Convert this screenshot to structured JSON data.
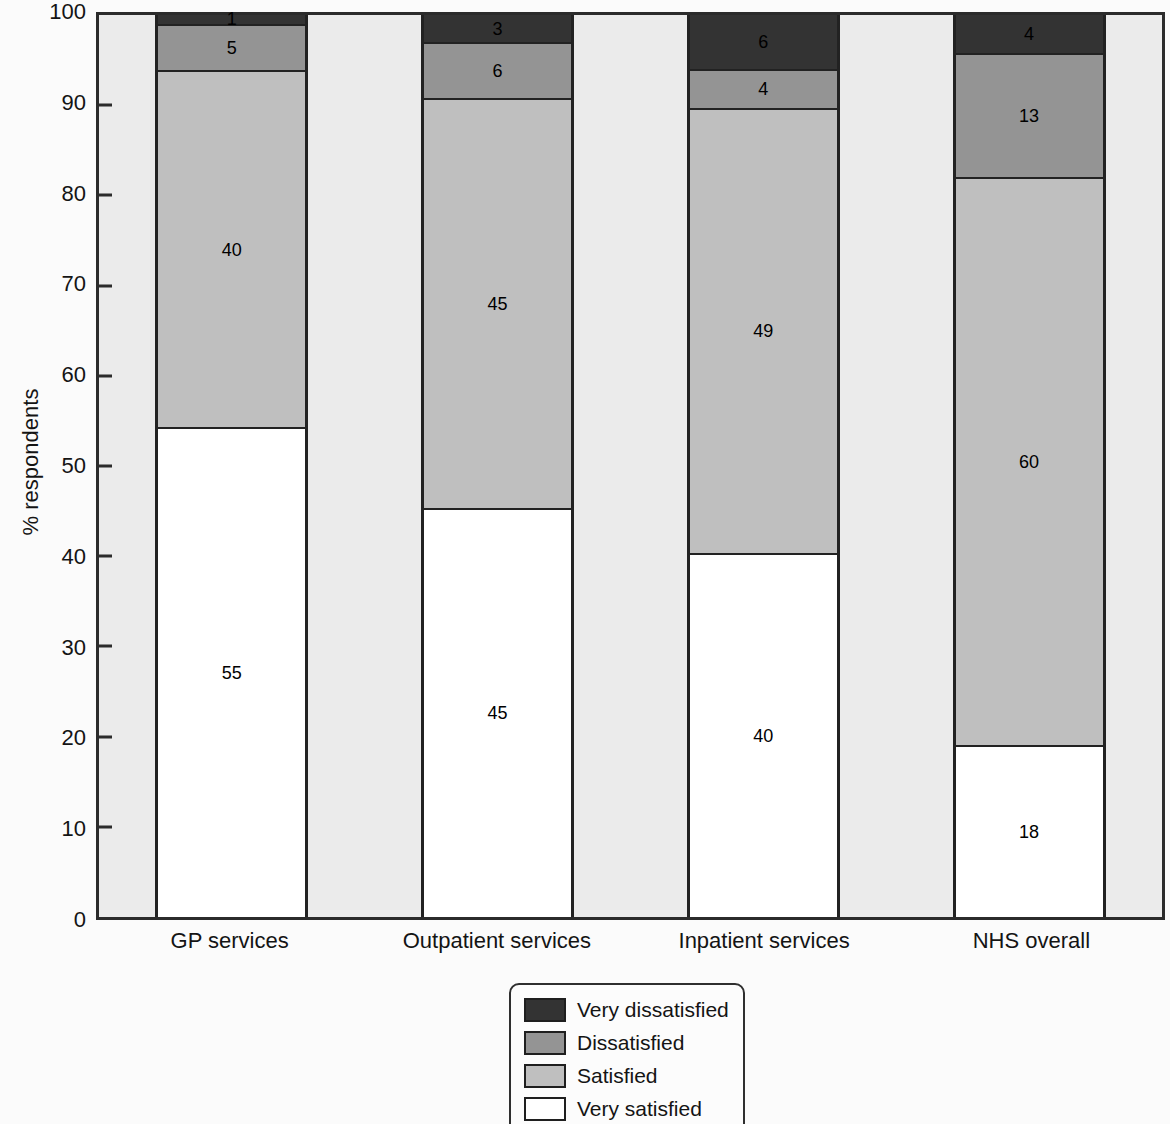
{
  "chart_data": {
    "type": "bar",
    "stacked": true,
    "categories": [
      "GP services",
      "Outpatient services",
      "Inpatient services",
      "NHS overall"
    ],
    "series": [
      {
        "name": "Very satisfied",
        "color": "#ffffff",
        "values": [
          55,
          45,
          40,
          18
        ]
      },
      {
        "name": "Satisfied",
        "color": "#bfbfbf",
        "values": [
          40,
          45,
          49,
          60
        ]
      },
      {
        "name": "Dissatisfied",
        "color": "#949494",
        "values": [
          5,
          6,
          4,
          13
        ]
      },
      {
        "name": "Very dissatisfied",
        "color": "#333333",
        "values": [
          1,
          3,
          6,
          4
        ]
      }
    ],
    "title": "",
    "xlabel": "",
    "ylabel": "% respondents",
    "ylim": [
      0,
      100
    ],
    "yticks": [
      0,
      10,
      20,
      30,
      40,
      50,
      60,
      70,
      80,
      90,
      100
    ],
    "grid": false,
    "plot_background": "#ebebeb",
    "frame_color": "#2b2b2b",
    "legend_position": "bottom-center"
  },
  "legend": {
    "items": [
      {
        "label": "Very dissatisfied",
        "color": "#333333"
      },
      {
        "label": "Dissatisfied",
        "color": "#949494"
      },
      {
        "label": "Satisfied",
        "color": "#bfbfbf"
      },
      {
        "label": "Very satisfied",
        "color": "#ffffff"
      }
    ]
  }
}
